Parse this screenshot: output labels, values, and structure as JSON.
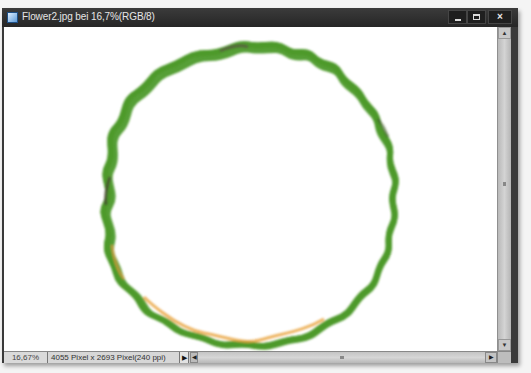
{
  "window": {
    "title": "Flower2.jpg bei 16,7%(RGB/8)",
    "buttons": {
      "minimize": "minimize",
      "maximize": "maximize",
      "close": "×"
    }
  },
  "canvas": {
    "background": "#ffffff",
    "content": "wreath-like wavy ring outline",
    "ring_colors": [
      "#4f9a2a",
      "#8cc63f",
      "#f2e84a",
      "#e8a23a",
      "#5a4a3a"
    ]
  },
  "statusbar": {
    "zoom": "16,67%",
    "info": "4055 Pixel x 2693 Pixel(240 ppi)",
    "info_arrow": "▶",
    "scroll_left": "◀",
    "scroll_right": "▶"
  },
  "scrollbar": {
    "up": "▲",
    "down": "▼"
  }
}
